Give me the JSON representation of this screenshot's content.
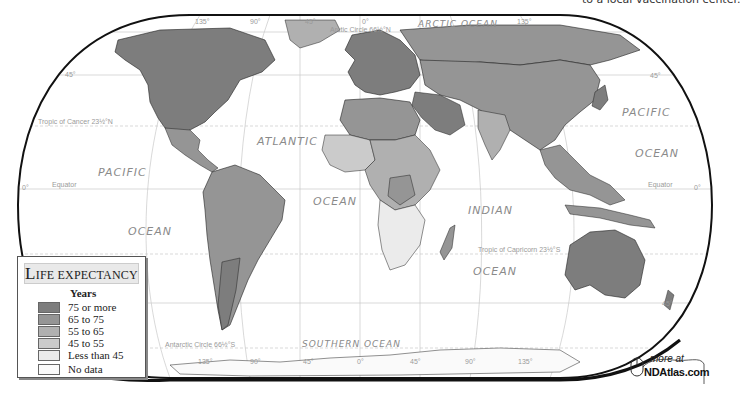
{
  "header": {
    "caption_fragment": "to a local vaccination center."
  },
  "map": {
    "title": "Life Expectancy",
    "oceans": {
      "arctic": "ARCTIC OCEAN",
      "pacific_left_1": "PACIFIC",
      "pacific_left_2": "OCEAN",
      "atlantic_1": "ATLANTIC",
      "atlantic_2": "OCEAN",
      "indian_1": "INDIAN",
      "indian_2": "OCEAN",
      "pacific_right_1": "PACIFIC",
      "pacific_right_2": "OCEAN",
      "southern": "SOUTHERN",
      "southern_2": "OCEAN"
    },
    "grid_labels": {
      "arctic_circle": "Arctic Circle 66½°N",
      "antarctic_circle": "Antarctic Circle 66½°S",
      "tropic_cancer": "Tropic of Cancer 23½°N",
      "tropic_capricorn": "Tropic of Capricorn 23½°S",
      "equator_left": "Equator",
      "equator_right": "Equator",
      "lat_45n_left": "45°",
      "lat_45n_right": "45°",
      "lat_45s_right": "45°",
      "lat_0_left": "0°",
      "lat_0_right": "0°",
      "lon_135w_top": "135°",
      "lon_90w_top": "90°",
      "lon_45w_top": "45°",
      "lon_0_top": "0°",
      "lon_135e_top": "135°",
      "lon_135w_bottom": "135°",
      "lon_90w_bottom": "90°",
      "lon_45w_bottom": "45°",
      "lon_0_bottom": "0°",
      "lon_45e_bottom": "45°",
      "lon_90e_bottom": "90°",
      "lon_135e_bottom": "135°"
    },
    "colors": {
      "75_plus": "#7d7d7d",
      "65_75": "#959595",
      "55_65": "#b0b0b0",
      "45_55": "#cbcbcb",
      "lt_45": "#ebebeb",
      "no_data": "#fafafa",
      "ocean": "#ffffff",
      "border": "#222222"
    }
  },
  "legend": {
    "title_first": "L",
    "title_rest": "IFE EXPECTANCY",
    "units": "Years",
    "items": [
      {
        "label": "75 or more",
        "color": "#7d7d7d"
      },
      {
        "label": "65 to 75",
        "color": "#959595"
      },
      {
        "label": "55 to 65",
        "color": "#b0b0b0"
      },
      {
        "label": "45 to 55",
        "color": "#cbcbcb"
      },
      {
        "label": "Less than 45",
        "color": "#ebebeb"
      },
      {
        "label": "No data",
        "color": "#fafafa"
      }
    ]
  },
  "badge": {
    "more_at": "more at",
    "site": "NDAtlas.com",
    "icon": "mouse-icon"
  }
}
